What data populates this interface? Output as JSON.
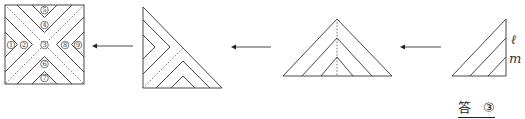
{
  "diagram": {
    "figures": [
      {
        "id": "square-unfolded",
        "shape": "square",
        "region_labels": [
          "①",
          "②",
          "③",
          "④",
          "⑤",
          "⑥",
          "⑦",
          "⑧",
          "⑨"
        ]
      },
      {
        "id": "right-triangle-step2",
        "shape": "right triangle"
      },
      {
        "id": "isosceles-triangle-step3",
        "shape": "isosceles triangle"
      },
      {
        "id": "folded-triangle-step4",
        "shape": "right triangle",
        "line_labels": {
          "l": "ℓ",
          "m": "m"
        }
      }
    ],
    "arrows": [
      "←",
      "←",
      "←"
    ]
  },
  "answer": {
    "label": "答",
    "value": "③"
  }
}
